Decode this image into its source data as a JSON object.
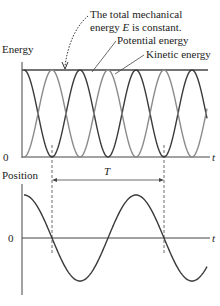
{
  "annotation": {
    "line1": "The total mechanical",
    "line2_pre": "energy ",
    "line2_var": "E",
    "line2_post": " is constant."
  },
  "energy_plot": {
    "ylabel": "Energy",
    "zero_label": "0",
    "xlabel": "t",
    "potential_label": "Potential energy",
    "kinetic_label": "Kinetic energy"
  },
  "position_plot": {
    "ylabel": "Position",
    "zero_label": "0",
    "xlabel": "t",
    "period_label": "T"
  },
  "colors": {
    "axis": "#444444",
    "potential": "#3a3a3a",
    "kinetic": "#8a8a8a",
    "total": "#444444",
    "position": "#3a3a3a",
    "text": "#222222"
  },
  "chart_data": [
    {
      "type": "line",
      "title": "Energy vs time",
      "xlabel": "t",
      "ylabel": "Energy",
      "series": [
        {
          "name": "Total mechanical energy E",
          "shape": "constant",
          "value": 1
        },
        {
          "name": "Potential energy",
          "shape": "cos^2",
          "period_relative_to_T": 0.5,
          "max": 1,
          "min": 0
        },
        {
          "name": "Kinetic energy",
          "shape": "sin^2",
          "period_relative_to_T": 0.5,
          "max": 1,
          "min": 0
        }
      ],
      "ylim": [
        0,
        1
      ]
    },
    {
      "type": "line",
      "title": "Position vs time",
      "xlabel": "t",
      "ylabel": "Position",
      "series": [
        {
          "name": "Position",
          "shape": "cos",
          "period": "T",
          "amplitude": 1
        }
      ],
      "annotations": [
        "Period T marked between two zero crossings"
      ]
    }
  ]
}
